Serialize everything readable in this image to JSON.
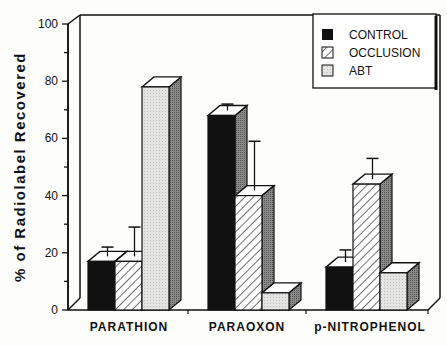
{
  "chart_data": {
    "type": "bar",
    "style": "3d-grouped",
    "title": "",
    "xlabel": "",
    "ylabel": "% of Radiolabel Recovered",
    "ylim": [
      0,
      100
    ],
    "yticks": [
      0,
      20,
      40,
      60,
      80,
      100
    ],
    "grid": false,
    "legend_position": "top-right",
    "categories": [
      "PARATHION",
      "PARAOXON",
      "p-NITROPHENOL"
    ],
    "series": [
      {
        "name": "CONTROL",
        "fill": "solid-black",
        "values": [
          17,
          68,
          15
        ],
        "error_top": [
          22,
          72,
          21
        ]
      },
      {
        "name": "OCCLUSION",
        "fill": "diagonal-hatch",
        "values": [
          17,
          40,
          44
        ],
        "error_top": [
          29,
          59,
          53
        ]
      },
      {
        "name": "ABT",
        "fill": "light-gray",
        "values": [
          78,
          6,
          13
        ],
        "error_top": [
          null,
          null,
          null
        ]
      }
    ]
  },
  "legend": {
    "items": [
      "CONTROL",
      "OCCLUSION",
      "ABT"
    ]
  },
  "axis": {
    "ylabel": "% of Radiolabel Recovered",
    "ticks": [
      "0",
      "20",
      "40",
      "60",
      "80",
      "100"
    ]
  },
  "categories": [
    "PARATHION",
    "PARAOXON",
    "p-NITROPHENOL"
  ]
}
